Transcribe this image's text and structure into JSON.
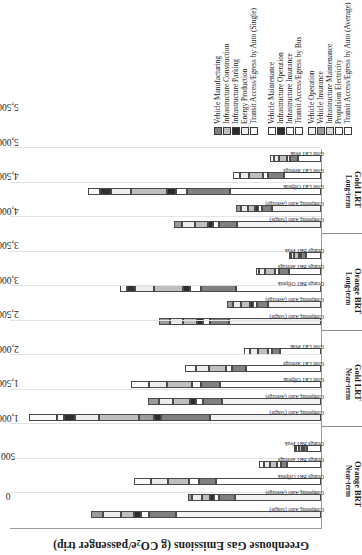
{
  "chart_data": {
    "type": "bar",
    "subtype": "stacked-horizontal-grouped",
    "title": "Greenhouse Gas Emissions (g CO2e/passenger trip)",
    "title_html": "Greenhouse Gas Emissions (g CO<sub>2</sub>e/passenger trip)",
    "xlabel": "",
    "ylabel": "Greenhouse Gas Emissions (g CO2e/passenger trip)",
    "ylim": [
      0,
      5500
    ],
    "ytick_step": 500,
    "yticks": [
      "0",
      "500",
      "1,000",
      "1,500",
      "2,000",
      "2,500",
      "3,000",
      "3,500",
      "4,000",
      "4,500",
      "5,000",
      "5,500"
    ],
    "grid": "vertical-light",
    "legend_position": "right-bottom",
    "groups": [
      {
        "scenario": "Orange BRT",
        "horizon": "Near-term",
        "categories": [
          "Competing Auto (Single)",
          "Competing Auto (Average)",
          "Orange BRT Offpeak",
          "Orange BRT Average",
          "Orange BRT Peak"
        ]
      },
      {
        "scenario": "Gold LRT",
        "horizon": "Near-term",
        "categories": [
          "Competing Auto (Single)",
          "Competing Auto (Average)",
          "Gold LRT Offpeak",
          "Gold LRT Average",
          "Gold LRT Peak"
        ]
      },
      {
        "scenario": "Orange BRT",
        "horizon": "Long-term",
        "categories": [
          "Competing Auto (Single)",
          "Competing Auto (Average)",
          "Orange BRT Offpeak",
          "Orange BRT Average",
          "Orange BRT Peak"
        ]
      },
      {
        "scenario": "Gold LRT",
        "horizon": "Long-term",
        "categories": [
          "Competing Auto (Single)",
          "Competing Auto (Average)",
          "Gold LRT Offpeak",
          "Gold LRT Average",
          "Gold LRT Peak"
        ]
      }
    ],
    "series": [
      {
        "name": "Vehicle Operation",
        "key": "veh_op",
        "color": "#f2f2f2"
      },
      {
        "name": "Vehicle Insurance",
        "key": "veh_ins",
        "color": "#9a9a9a"
      },
      {
        "name": "Infrastructure Maintenance",
        "key": "inf_mnt",
        "color": "#d9d9d9"
      },
      {
        "name": "Propulsion Electricity",
        "key": "prop_el",
        "color": "#ffffff"
      },
      {
        "name": "Transit Access/Egress by Auto (Single)",
        "key": "acc_sing",
        "color": "#fafafa"
      },
      {
        "name": "Vehicle Manufacturing",
        "key": "veh_mfg",
        "color": "#808080"
      },
      {
        "name": "Infrastructure Construction",
        "key": "inf_con",
        "color": "#bfbfbf"
      },
      {
        "name": "Infrastructure Parking",
        "key": "inf_park",
        "color": "#2b2b2b"
      },
      {
        "name": "Energy Production",
        "key": "en_prod",
        "color": "#ececec"
      },
      {
        "name": "Transit Access/Egress by Auto (Average)",
        "key": "acc_avg",
        "color": "#ffffff"
      },
      {
        "name": "Vehicle Maintenance",
        "key": "veh_mnt",
        "color": "#ffffff"
      },
      {
        "name": "Infrastructure Operation",
        "key": "inf_op",
        "color": "#303030"
      },
      {
        "name": "Infrastructure Insurance",
        "key": "inf_insu",
        "color": "#ffffff"
      },
      {
        "name": "Transit Access/Egress by Bus",
        "key": "acc_bus",
        "color": "#ffffff"
      }
    ],
    "legend_left": [
      "Vehicle Manufacturing",
      "Infrastructure Construction",
      "Infrastructure Parking",
      "Energy Production",
      "Transit Access/Egress by Auto (Single)"
    ],
    "legend_right": [
      "Vehicle Maintenance",
      "Infrastructure Operation",
      "Infrastructure Insurance",
      "Transit Access/Egress by Bus"
    ],
    "legend_bottom_left": [
      "Vehicle Operation",
      "Vehicle Insurance",
      "Infrastructure Maintenance",
      "Propulsion Electricity",
      "Transit Access/Egress by Auto (Average)"
    ],
    "bars": [
      {
        "group": 0,
        "label": "Competing Auto (Single)",
        "total": 4050,
        "stack": [
          [
            "veh_op",
            2550
          ],
          [
            "veh_mfg",
            480
          ],
          [
            "veh_mnt",
            150
          ],
          [
            "inf_park",
            120
          ],
          [
            "inf_con",
            230
          ],
          [
            "en_prod",
            320
          ],
          [
            "veh_ins",
            200
          ]
        ]
      },
      {
        "group": 0,
        "label": "Competing Auto (Average)",
        "total": 2350,
        "stack": [
          [
            "veh_op",
            1520
          ],
          [
            "veh_mfg",
            280
          ],
          [
            "veh_mnt",
            90
          ],
          [
            "inf_park",
            70
          ],
          [
            "inf_con",
            135
          ],
          [
            "en_prod",
            180
          ],
          [
            "veh_ins",
            75
          ]
        ]
      },
      {
        "group": 0,
        "label": "Orange BRT Offpeak",
        "total": 3300,
        "stack": [
          [
            "prop_el",
            1850
          ],
          [
            "veh_mfg",
            300
          ],
          [
            "veh_mnt",
            180
          ],
          [
            "inf_con",
            360
          ],
          [
            "en_prod",
            300
          ],
          [
            "acc_sing",
            310
          ]
        ]
      },
      {
        "group": 0,
        "label": "Orange BRT Average",
        "total": 1100,
        "stack": [
          [
            "prop_el",
            600
          ],
          [
            "veh_mfg",
            110
          ],
          [
            "veh_mnt",
            60
          ],
          [
            "inf_con",
            130
          ],
          [
            "en_prod",
            100
          ],
          [
            "acc_avg",
            100
          ]
        ]
      },
      {
        "group": 0,
        "label": "Orange BRT Peak",
        "total": 480,
        "stack": [
          [
            "prop_el",
            250
          ],
          [
            "veh_mfg",
            55
          ],
          [
            "veh_mnt",
            30
          ],
          [
            "inf_con",
            60
          ],
          [
            "en_prod",
            45
          ],
          [
            "acc_bus",
            40
          ]
        ]
      },
      {
        "group": 1,
        "label": "Competing Auto (Single)",
        "total": 5150,
        "stack": [
          [
            "veh_op",
            1950
          ],
          [
            "veh_mfg",
            870
          ],
          [
            "inf_park",
            130
          ],
          [
            "veh_ins",
            260
          ],
          [
            "inf_con",
            700
          ],
          [
            "en_prod",
            430
          ],
          [
            "inf_op",
            190
          ],
          [
            "inf_insu",
            130
          ],
          [
            "acc_sing",
            490
          ]
        ]
      },
      {
        "group": 1,
        "label": "Competing Auto (Average)",
        "total": 3050,
        "stack": [
          [
            "veh_op",
            1750
          ],
          [
            "veh_mfg",
            330
          ],
          [
            "veh_mnt",
            130
          ],
          [
            "inf_park",
            95
          ],
          [
            "inf_con",
            300
          ],
          [
            "en_prod",
            250
          ],
          [
            "veh_ins",
            195
          ]
        ]
      },
      {
        "group": 1,
        "label": "Gold LRT Offpeak",
        "total": 3350,
        "stack": [
          [
            "prop_el",
            1780
          ],
          [
            "veh_mfg",
            330
          ],
          [
            "veh_mnt",
            160
          ],
          [
            "inf_con",
            440
          ],
          [
            "en_prod",
            320
          ],
          [
            "acc_sing",
            320
          ]
        ]
      },
      {
        "group": 1,
        "label": "Gold LRT Average",
        "total": 2400,
        "stack": [
          [
            "prop_el",
            1330
          ],
          [
            "veh_mfg",
            240
          ],
          [
            "veh_mnt",
            110
          ],
          [
            "inf_con",
            300
          ],
          [
            "en_prod",
            230
          ],
          [
            "acc_avg",
            190
          ]
        ]
      },
      {
        "group": 1,
        "label": "Gold LRT Peak",
        "total": 1350,
        "stack": [
          [
            "prop_el",
            730
          ],
          [
            "veh_mfg",
            140
          ],
          [
            "veh_mnt",
            70
          ],
          [
            "inf_con",
            175
          ],
          [
            "en_prod",
            130
          ],
          [
            "acc_bus",
            105
          ]
        ]
      },
      {
        "group": 2,
        "label": "Competing Auto (Single)",
        "total": 2850,
        "stack": [
          [
            "veh_op",
            1620
          ],
          [
            "veh_mfg",
            340
          ],
          [
            "veh_mnt",
            120
          ],
          [
            "inf_park",
            110
          ],
          [
            "inf_con",
            250
          ],
          [
            "en_prod",
            230
          ],
          [
            "veh_ins",
            180
          ]
        ]
      },
      {
        "group": 2,
        "label": "Competing Auto (Average)",
        "total": 1650,
        "stack": [
          [
            "veh_op",
            930
          ],
          [
            "veh_mfg",
            200
          ],
          [
            "veh_mnt",
            70
          ],
          [
            "inf_park",
            60
          ],
          [
            "inf_con",
            150
          ],
          [
            "en_prod",
            140
          ],
          [
            "veh_ins",
            100
          ]
        ]
      },
      {
        "group": 2,
        "label": "Orange BRT Offpeak",
        "total": 3550,
        "stack": [
          [
            "prop_el",
            1500
          ],
          [
            "veh_mfg",
            620
          ],
          [
            "veh_mnt",
            190
          ],
          [
            "inf_park",
            120
          ],
          [
            "inf_con",
            520
          ],
          [
            "en_prod",
            330
          ],
          [
            "inf_op",
            140
          ],
          [
            "acc_sing",
            130
          ]
        ]
      },
      {
        "group": 2,
        "label": "Orange BRT Average",
        "total": 1150,
        "stack": [
          [
            "prop_el",
            560
          ],
          [
            "veh_mfg",
            180
          ],
          [
            "veh_mnt",
            70
          ],
          [
            "inf_con",
            180
          ],
          [
            "en_prod",
            100
          ],
          [
            "acc_avg",
            60
          ]
        ]
      },
      {
        "group": 2,
        "label": "Orange BRT Peak",
        "total": 560,
        "stack": [
          [
            "prop_el",
            270
          ],
          [
            "veh_mfg",
            80
          ],
          [
            "veh_mnt",
            40
          ],
          [
            "inf_con",
            85
          ],
          [
            "en_prod",
            50
          ],
          [
            "acc_bus",
            35
          ]
        ]
      },
      {
        "group": 3,
        "label": "Competing Auto (Single)",
        "total": 2600,
        "stack": [
          [
            "veh_op",
            1480
          ],
          [
            "veh_mfg",
            310
          ],
          [
            "veh_mnt",
            110
          ],
          [
            "inf_park",
            100
          ],
          [
            "inf_con",
            230
          ],
          [
            "en_prod",
            215
          ],
          [
            "veh_ins",
            155
          ]
        ]
      },
      {
        "group": 3,
        "label": "Competing Auto (Average)",
        "total": 1500,
        "stack": [
          [
            "veh_op",
            860
          ],
          [
            "veh_mfg",
            180
          ],
          [
            "veh_mnt",
            65
          ],
          [
            "inf_park",
            55
          ],
          [
            "inf_con",
            135
          ],
          [
            "en_prod",
            125
          ],
          [
            "veh_ins",
            80
          ]
        ]
      },
      {
        "group": 3,
        "label": "Gold LRT Offpeak",
        "total": 4100,
        "stack": [
          [
            "prop_el",
            1600
          ],
          [
            "veh_mfg",
            760
          ],
          [
            "veh_mnt",
            200
          ],
          [
            "inf_park",
            150
          ],
          [
            "inf_con",
            640
          ],
          [
            "en_prod",
            360
          ],
          [
            "inf_op",
            180
          ],
          [
            "acc_sing",
            210
          ]
        ]
      },
      {
        "group": 3,
        "label": "Gold LRT Average",
        "total": 1550,
        "stack": [
          [
            "prop_el",
            660
          ],
          [
            "veh_mfg",
            280
          ],
          [
            "veh_mnt",
            85
          ],
          [
            "inf_con",
            250
          ],
          [
            "en_prod",
            150
          ],
          [
            "acc_avg",
            125
          ]
        ]
      },
      {
        "group": 3,
        "label": "Gold LRT Peak",
        "total": 900,
        "stack": [
          [
            "prop_el",
            400
          ],
          [
            "veh_mfg",
            155
          ],
          [
            "veh_mnt",
            50
          ],
          [
            "inf_con",
            140
          ],
          [
            "en_prod",
            85
          ],
          [
            "acc_bus",
            70
          ]
        ]
      }
    ]
  }
}
